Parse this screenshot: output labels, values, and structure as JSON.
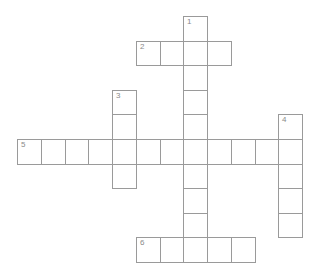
{
  "puzzle": {
    "type": "crossword",
    "grid": {
      "origin_x": 17,
      "origin_y": 16,
      "cell_w": 23.75,
      "cell_h": 24.6
    },
    "border_color": "#9a9a9a",
    "number_color": "#8a8a8a",
    "words": [
      {
        "number": "1",
        "direction": "down",
        "row": 0,
        "col": 7,
        "length": 10
      },
      {
        "number": "2",
        "direction": "across",
        "row": 1,
        "col": 5,
        "length": 4
      },
      {
        "number": "3",
        "direction": "down",
        "row": 3,
        "col": 4,
        "length": 4
      },
      {
        "number": "4",
        "direction": "down",
        "row": 4,
        "col": 11,
        "length": 5
      },
      {
        "number": "5",
        "direction": "across",
        "row": 5,
        "col": 0,
        "length": 12
      },
      {
        "number": "6",
        "direction": "across",
        "row": 9,
        "col": 5,
        "length": 5
      }
    ]
  }
}
